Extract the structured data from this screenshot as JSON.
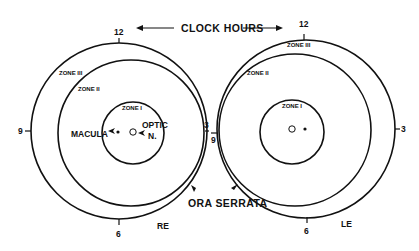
{
  "title_label": "CLOCK HOURS",
  "ora_serrata_label": "ORA SERRATA",
  "right_eye": {
    "label": "RE",
    "clock": {
      "twelve": "12",
      "three": "3",
      "six": "6",
      "nine": "9"
    },
    "zones": {
      "zone1": "ZONE I",
      "zone2": "ZONE II",
      "zone3": "ZONE III"
    },
    "macula_label": "MACULA",
    "optic_label_line1": "OPTIC",
    "optic_label_line2": "N."
  },
  "left_eye": {
    "label": "LE",
    "clock": {
      "twelve": "12",
      "three": "3",
      "six": "6",
      "nine": "9"
    },
    "zones": {
      "zone1": "ZONE I",
      "zone2": "ZONE II",
      "zone3": "ZONE III"
    }
  },
  "colors": {
    "ink": "#111111",
    "background": "#ffffff"
  }
}
